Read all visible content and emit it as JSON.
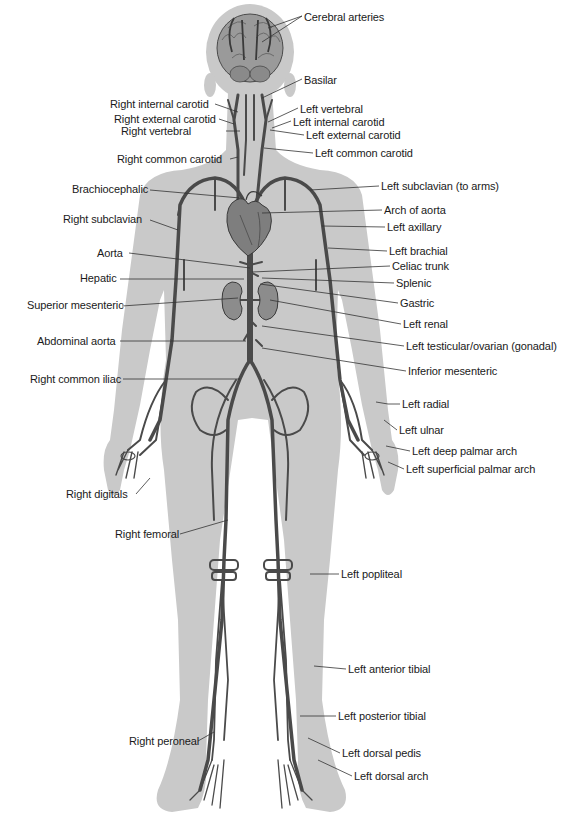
{
  "diagram": {
    "type": "anatomical-diagram",
    "colors": {
      "background": "#ffffff",
      "silhouette": "#c8c8c8",
      "vessel": "#4a4a4a",
      "organ": "#7a7a7a",
      "leader_line": "#333333",
      "text": "#1a1a1a"
    }
  },
  "labels": {
    "cerebral_arteries": {
      "text": "Cerebral arteries",
      "x": 304,
      "y": 11,
      "side": "right"
    },
    "basilar": {
      "text": "Basilar",
      "x": 304,
      "y": 74,
      "side": "right"
    },
    "right_internal_carotid": {
      "text": "Right internal carotid",
      "x": 110,
      "y": 98,
      "side": "left"
    },
    "left_vertebral": {
      "text": "Left vertebral",
      "x": 300,
      "y": 104,
      "side": "right"
    },
    "right_external_carotid": {
      "text": "Right external carotid",
      "x": 114,
      "y": 113,
      "side": "left"
    },
    "left_internal_carotid": {
      "text": "Left internal carotid",
      "x": 293,
      "y": 117,
      "side": "right"
    },
    "right_vertebral": {
      "text": "Right vertebral",
      "x": 150,
      "y": 125,
      "side": "left"
    },
    "left_external_carotid": {
      "text": "Left external carotid",
      "x": 306,
      "y": 130,
      "side": "right"
    },
    "right_common_carotid": {
      "text": "Right common carotid",
      "x": 117,
      "y": 153,
      "side": "left"
    },
    "left_common_carotid": {
      "text": "Left common carotid",
      "x": 315,
      "y": 148,
      "side": "right"
    },
    "brachiocephalic": {
      "text": "Brachiocephalic",
      "x": 72,
      "y": 184,
      "side": "left"
    },
    "left_subclavian": {
      "text": "Left subclavian (to arms)",
      "x": 381,
      "y": 181,
      "side": "right"
    },
    "arch_of_aorta": {
      "text": "Arch of aorta",
      "x": 384,
      "y": 205,
      "side": "right"
    },
    "right_subclavian": {
      "text": "Right subclavian",
      "x": 63,
      "y": 214,
      "side": "left"
    },
    "left_axillary": {
      "text": "Left axillary",
      "x": 387,
      "y": 222,
      "side": "right"
    },
    "aorta": {
      "text": "Aorta",
      "x": 97,
      "y": 248,
      "side": "left"
    },
    "left_brachial": {
      "text": "Left brachial",
      "x": 389,
      "y": 246,
      "side": "right"
    },
    "celiac_trunk": {
      "text": "Celiac trunk",
      "x": 392,
      "y": 261,
      "side": "right"
    },
    "hepatic": {
      "text": "Hepatic",
      "x": 80,
      "y": 273,
      "side": "left"
    },
    "splenic": {
      "text": "Splenic",
      "x": 396,
      "y": 278,
      "side": "right"
    },
    "superior_mesenteric": {
      "text": "Superior mesenteric",
      "x": 27,
      "y": 300,
      "side": "left"
    },
    "gastric": {
      "text": "Gastric",
      "x": 400,
      "y": 298,
      "side": "right"
    },
    "left_renal": {
      "text": "Left renal",
      "x": 403,
      "y": 319,
      "side": "right"
    },
    "abdominal_aorta": {
      "text": "Abdominal aorta",
      "x": 37,
      "y": 336,
      "side": "left"
    },
    "left_gonadal": {
      "text": "Left testicular/ovarian (gonadal)",
      "x": 406,
      "y": 341,
      "side": "right"
    },
    "inferior_mesenteric": {
      "text": "Inferior mesenteric",
      "x": 408,
      "y": 366,
      "side": "right"
    },
    "right_common_iliac": {
      "text": "Right common iliac",
      "x": 30,
      "y": 374,
      "side": "left"
    },
    "left_radial": {
      "text": "Left radial",
      "x": 402,
      "y": 399,
      "side": "right"
    },
    "left_ulnar": {
      "text": "Left ulnar",
      "x": 399,
      "y": 425,
      "side": "right"
    },
    "left_deep_palmar_arch": {
      "text": "Left deep palmar arch",
      "x": 412,
      "y": 446,
      "side": "right"
    },
    "left_superficial_palmar_arch": {
      "text": "Left superficial palmar arch",
      "x": 406,
      "y": 464,
      "side": "right"
    },
    "right_digitals": {
      "text": "Right digitals",
      "x": 66,
      "y": 489,
      "side": "left"
    },
    "right_femoral": {
      "text": "Right femoral",
      "x": 115,
      "y": 529,
      "side": "left"
    },
    "left_popliteal": {
      "text": "Left popliteal",
      "x": 341,
      "y": 569,
      "side": "right"
    },
    "left_anterior_tibial": {
      "text": "Left anterior tibial",
      "x": 348,
      "y": 664,
      "side": "right"
    },
    "left_posterior_tibial": {
      "text": "Left posterior tibial",
      "x": 338,
      "y": 711,
      "side": "right"
    },
    "right_peroneal": {
      "text": "Right peroneal",
      "x": 129,
      "y": 736,
      "side": "left"
    },
    "left_dorsal_pedis": {
      "text": "Left dorsal pedis",
      "x": 342,
      "y": 748,
      "side": "right"
    },
    "left_dorsal_arch": {
      "text": "Left dorsal arch",
      "x": 354,
      "y": 771,
      "side": "right"
    }
  }
}
